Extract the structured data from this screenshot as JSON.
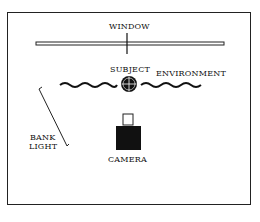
{
  "diagram": {
    "type": "lighting-setup-plan",
    "labels": {
      "window": "WINDOW",
      "subject": "SUBJECT",
      "environment": "ENVIRONMENT",
      "bank_light_line1": "BANK",
      "bank_light_line2": "LIGHT",
      "camera": "CAMERA"
    },
    "elements": [
      {
        "id": "window",
        "shape": "double-line bar with center tick"
      },
      {
        "id": "environment",
        "shape": "wavy line"
      },
      {
        "id": "subject",
        "shape": "circle with crosshair"
      },
      {
        "id": "bank-light",
        "shape": "angled line"
      },
      {
        "id": "camera",
        "shape": "black square body with small outlined viewfinder"
      }
    ],
    "colors": {
      "ink": "#111111",
      "background": "#ffffff"
    }
  }
}
